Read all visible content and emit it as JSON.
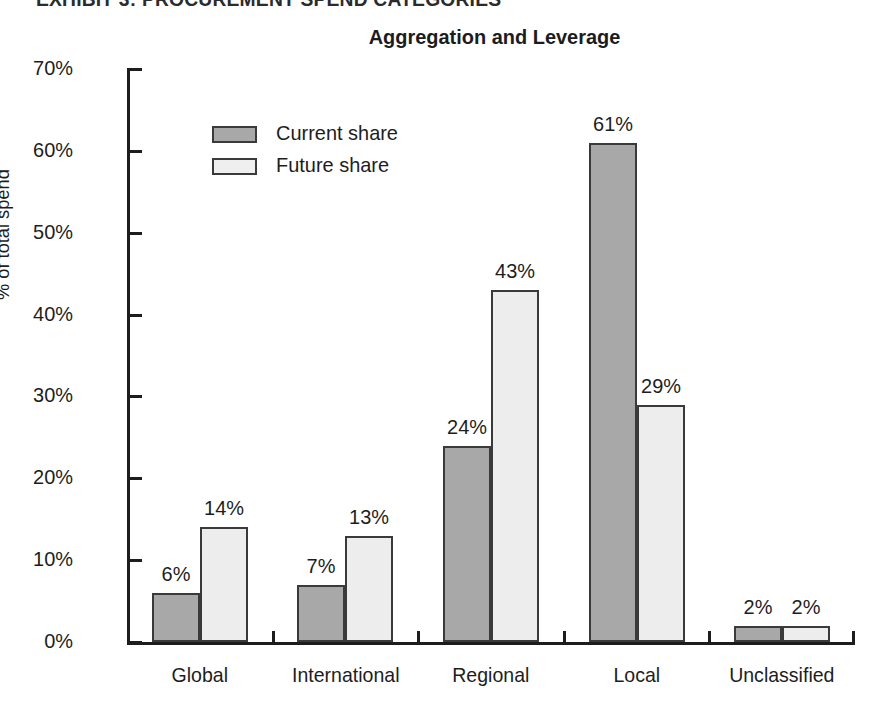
{
  "exhibit": {
    "header": "EXHIBIT 3: PROCUREMENT SPEND CATEGORIES"
  },
  "legend": {
    "position": "inside-top-left",
    "items": [
      {
        "label": "Current share",
        "color": "#a8a8a8",
        "swatch": "legend-swatch-current"
      },
      {
        "label": "Future share",
        "color": "#ededed",
        "swatch": "legend-swatch-future"
      }
    ]
  },
  "axis": {
    "y_title": "% of total spend",
    "y_ticks": [
      "0%",
      "10%",
      "20%",
      "30%",
      "40%",
      "50%",
      "60%",
      "70%"
    ]
  },
  "chart_data": {
    "type": "bar",
    "title": "Aggregation and Leverage",
    "xlabel": "",
    "ylabel": "% of total spend",
    "ylim": [
      0,
      70
    ],
    "ytick_values": [
      0,
      10,
      20,
      30,
      40,
      50,
      60,
      70
    ],
    "ytick_labels": [
      "0%",
      "10%",
      "20%",
      "30%",
      "40%",
      "50%",
      "60%",
      "70%"
    ],
    "grid": false,
    "legend_position": "upper left (inside plot)",
    "categories": [
      "Global",
      "International",
      "Regional",
      "Local",
      "Unclassified"
    ],
    "series": [
      {
        "name": "Current share",
        "color": "#a8a8a8",
        "values": [
          6,
          7,
          24,
          61,
          2
        ],
        "labels": [
          "6%",
          "7%",
          "24%",
          "61%",
          "2%"
        ]
      },
      {
        "name": "Future share",
        "color": "#ededed",
        "values": [
          14,
          13,
          43,
          29,
          2
        ],
        "labels": [
          "14%",
          "13%",
          "43%",
          "29%",
          "2%"
        ]
      }
    ]
  }
}
